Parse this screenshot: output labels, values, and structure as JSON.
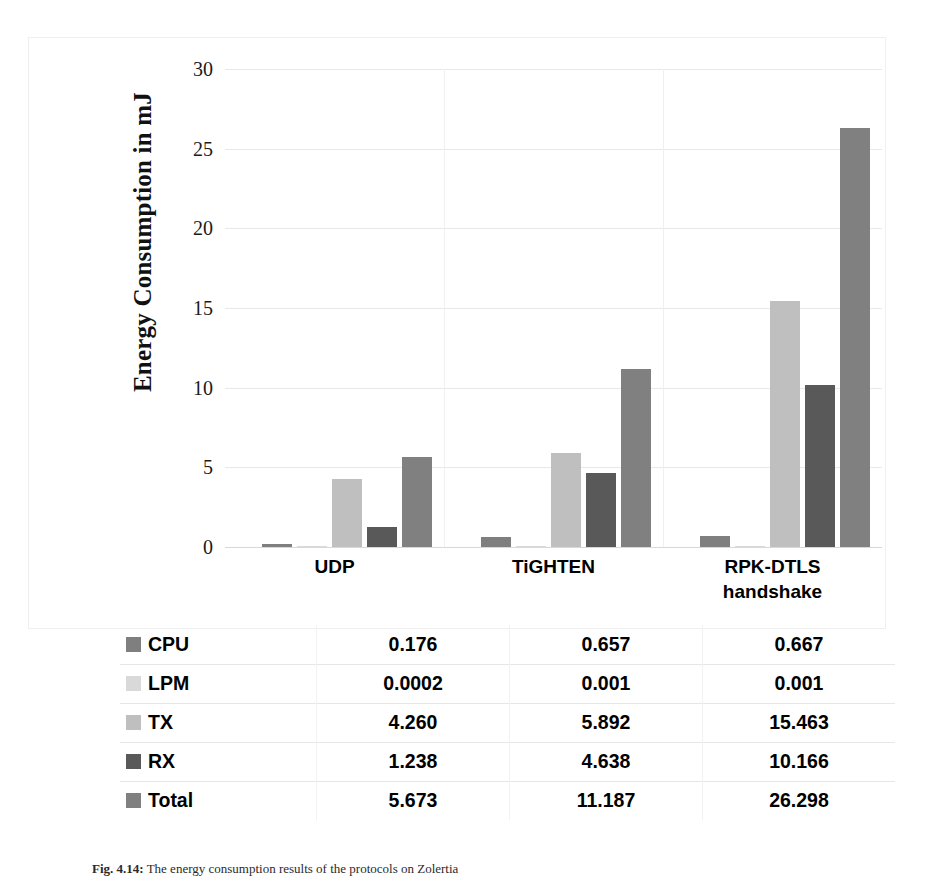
{
  "chart_data": {
    "type": "bar",
    "title": "",
    "xlabel": "",
    "ylabel": "Energy Consumption in mJ",
    "ylim": [
      0,
      30
    ],
    "yticks": [
      0,
      5,
      10,
      15,
      20,
      25,
      30
    ],
    "ytick_labels": [
      "0",
      "5",
      "10",
      "15",
      "20",
      "25",
      "30"
    ],
    "grid": true,
    "legend_position": "below-as-table",
    "categories": [
      "UDP",
      "TiGHTEN",
      "RPK-DTLS handshake"
    ],
    "category_lines": [
      [
        "UDP"
      ],
      [
        "TiGHTEN"
      ],
      [
        "RPK-DTLS",
        "handshake"
      ]
    ],
    "series": [
      {
        "name": "CPU",
        "color": "#7f7f7f",
        "values": [
          0.176,
          0.657,
          0.667
        ],
        "labels": [
          "0.176",
          "0.657",
          "0.667"
        ]
      },
      {
        "name": "LPM",
        "color": "#d9d9d9",
        "values": [
          0.0002,
          0.001,
          0.001
        ],
        "labels": [
          "0.0002",
          "0.001",
          "0.001"
        ]
      },
      {
        "name": "TX",
        "color": "#bfbfbf",
        "values": [
          4.26,
          5.892,
          15.463
        ],
        "labels": [
          "4.260",
          "5.892",
          "15.463"
        ]
      },
      {
        "name": "RX",
        "color": "#595959",
        "color_alt": "#4d4d4d",
        "values": [
          1.238,
          4.638,
          10.166
        ],
        "labels": [
          "1.238",
          "4.638",
          "10.166"
        ]
      },
      {
        "name": "Total",
        "color": "#808080",
        "values": [
          5.673,
          11.187,
          26.298
        ],
        "labels": [
          "5.673",
          "11.187",
          "26.298"
        ]
      }
    ]
  },
  "axis": {
    "y_title": "Energy Consumption in mJ"
  },
  "table": {
    "rows": [
      {
        "name": "CPU",
        "swatch": "#7f7f7f",
        "values": [
          "0.176",
          "0.657",
          "0.667"
        ]
      },
      {
        "name": "LPM",
        "swatch": "#d9d9d9",
        "values": [
          "0.0002",
          "0.001",
          "0.001"
        ]
      },
      {
        "name": "TX",
        "swatch": "#bfbfbf",
        "values": [
          "4.260",
          "5.892",
          "15.463"
        ]
      },
      {
        "name": "RX",
        "swatch": "#595959",
        "values": [
          "1.238",
          "4.638",
          "10.166"
        ]
      },
      {
        "name": "Total",
        "swatch": "#808080",
        "values": [
          "5.673",
          "11.187",
          "26.298"
        ]
      }
    ]
  },
  "caption": {
    "number": "Fig. 4.14:",
    "text": "The energy consumption results of the protocols on Zolertia"
  },
  "colors": {
    "gridline": "#e8e8e8",
    "baseline": "#d8d8d8",
    "frame": "#efefef",
    "text": "#000000"
  }
}
